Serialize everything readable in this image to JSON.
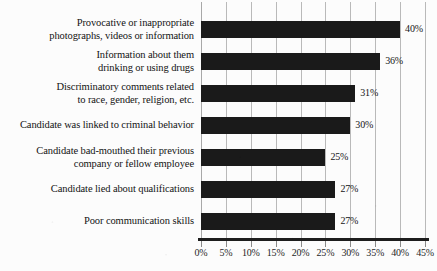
{
  "chart_data": {
    "type": "bar",
    "orientation": "horizontal",
    "title": "",
    "subtitle": "",
    "xlabel": "",
    "ylabel": "",
    "xlim": [
      0,
      45
    ],
    "grid": true,
    "legend": null,
    "categories": [
      "Provocative or inappropriate photographs, videos or information",
      "Information about them drinking or using drugs",
      "Discriminatory comments related to race, gender, religion, etc.",
      "Candidate was linked to criminal behavior",
      "Candidate bad-mouthed their previous company or fellow employee",
      "Candidate lied about qualifications",
      "Poor communication skills"
    ],
    "values": [
      40,
      36,
      31,
      30,
      25,
      27,
      27
    ],
    "value_labels": [
      "40%",
      "36%",
      "31%",
      "30%",
      "25%",
      "27%",
      "27%"
    ],
    "xticks": [
      0,
      5,
      10,
      15,
      20,
      25,
      30,
      35,
      40,
      45
    ],
    "xtick_labels": [
      "0%",
      "5%",
      "10%",
      "15%",
      "20%",
      "25%",
      "30%",
      "35%",
      "40%",
      "45%"
    ],
    "colors": {
      "bar": "#1a1a1a",
      "background": "#fcfcfc",
      "gridline": "#b9b9b9",
      "axis": "#1d1d1d",
      "text": "#131313"
    }
  },
  "category_lines": [
    [
      "Provocative or inappropriate",
      "photographs, videos or information"
    ],
    [
      "Information about them",
      "drinking or using drugs"
    ],
    [
      "Discriminatory comments related",
      "to race, gender, religion, etc."
    ],
    [
      "Candidate was linked to criminal behavior"
    ],
    [
      "Candidate bad-mouthed their previous",
      "company or fellow employee"
    ],
    [
      "Candidate lied about qualifications"
    ],
    [
      "Poor communication skills"
    ]
  ]
}
